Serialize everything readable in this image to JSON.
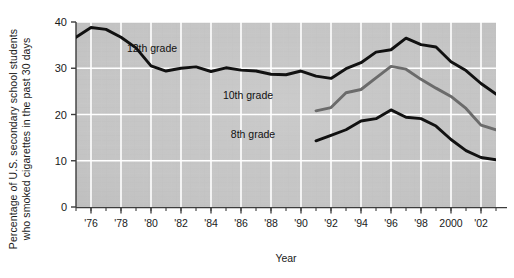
{
  "chart_data": {
    "type": "line",
    "title": "",
    "xlabel": "Year",
    "ylabel_line1": "Percentage of U.S. secondary school students",
    "ylabel_line2": "who smoked cigarettes in the past 30 days",
    "ylim": [
      0,
      40
    ],
    "yticks": [
      0,
      10,
      20,
      30,
      40
    ],
    "ytick_labels": [
      "0",
      "10",
      "20",
      "30",
      "40"
    ],
    "xlim": [
      1975,
      2003
    ],
    "xticks": [
      1976,
      1978,
      1980,
      1982,
      1984,
      1986,
      1988,
      1990,
      1992,
      1994,
      1996,
      1998,
      2000,
      2002
    ],
    "xtick_labels": [
      "'76",
      "'78",
      "'80",
      "'82",
      "'84",
      "'86",
      "'88",
      "'90",
      "'92",
      "'94",
      "'96",
      "'98",
      "2000",
      "'02"
    ],
    "grid": true,
    "grid_color": "#ffffff",
    "plot_background": "#c5c5c5",
    "legend_position": "inline-annotations",
    "series": [
      {
        "name": "12th grade",
        "color": "#111111",
        "label_annotation": "12th grade",
        "x": [
          1975,
          1976,
          1977,
          1978,
          1979,
          1980,
          1981,
          1982,
          1983,
          1984,
          1985,
          1986,
          1987,
          1988,
          1989,
          1990,
          1991,
          1992,
          1993,
          1994,
          1995,
          1996,
          1997,
          1998,
          1999,
          2000,
          2001,
          2002,
          2003
        ],
        "values": [
          36.7,
          38.8,
          38.4,
          36.7,
          34.4,
          30.5,
          29.4,
          30.0,
          30.3,
          29.3,
          30.1,
          29.6,
          29.4,
          28.7,
          28.6,
          29.4,
          28.3,
          27.8,
          29.9,
          31.2,
          33.5,
          34.0,
          36.5,
          35.1,
          34.6,
          31.4,
          29.5,
          26.7,
          24.4
        ]
      },
      {
        "name": "10th grade",
        "color": "#6b6b6b",
        "label_annotation": "10th grade",
        "x": [
          1991,
          1992,
          1993,
          1994,
          1995,
          1996,
          1997,
          1998,
          1999,
          2000,
          2001,
          2002,
          2003
        ],
        "values": [
          20.8,
          21.5,
          24.7,
          25.4,
          27.9,
          30.4,
          29.8,
          27.6,
          25.7,
          23.9,
          21.3,
          17.7,
          16.7
        ]
      },
      {
        "name": "8th grade",
        "color": "#111111",
        "label_annotation": "8th grade",
        "x": [
          1991,
          1992,
          1993,
          1994,
          1995,
          1996,
          1997,
          1998,
          1999,
          2000,
          2001,
          2002,
          2003
        ],
        "values": [
          14.3,
          15.5,
          16.7,
          18.6,
          19.1,
          21.0,
          19.4,
          19.1,
          17.5,
          14.6,
          12.2,
          10.7,
          10.2
        ]
      }
    ],
    "annotations": [
      {
        "text": "12th grade",
        "x_px": 152,
        "y_px": 52
      },
      {
        "text": "10th grade",
        "x_px": 248,
        "y_px": 99
      },
      {
        "text": "8th grade",
        "x_px": 253,
        "y_px": 138
      }
    ]
  }
}
